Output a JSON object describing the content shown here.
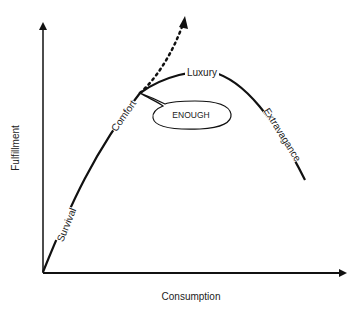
{
  "diagram": {
    "type": "fulfillment-curve",
    "axes": {
      "x_label": "Consumption",
      "y_label": "Fulfillment"
    },
    "curve_labels": {
      "survival": "Survival",
      "comfort": "Comfort",
      "luxury": "Luxury",
      "extravagance": "Extravagance"
    },
    "callout": {
      "text": "ENOUGH"
    },
    "colors": {
      "line": "#111111",
      "background": "#ffffff"
    }
  }
}
